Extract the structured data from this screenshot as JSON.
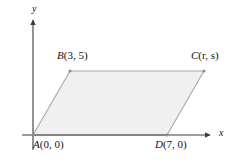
{
  "figure": {
    "type": "coordinate-geometry-diagram",
    "background_color": "#ffffff",
    "axes": {
      "x_axis_label": "x",
      "y_axis_label": "y",
      "axis_color": "#3a3a3a",
      "origin_px": {
        "x": 33,
        "y": 135
      },
      "x_axis_arrow_tip_px": {
        "x": 213,
        "y": 135
      },
      "y_axis_arrow_tip_px": {
        "x": 33,
        "y": 17
      }
    },
    "shape": {
      "name": "parallelogram",
      "fill_color": "#f0f0f0",
      "stroke_color": "#a8a8a8",
      "vertex_order": [
        "A",
        "B",
        "C",
        "D"
      ]
    },
    "points": [
      {
        "id": "A",
        "name": "A",
        "coords": "(0, 0)",
        "label": "A(0, 0)",
        "px": {
          "x": 33,
          "y": 135
        }
      },
      {
        "id": "B",
        "name": "B",
        "coords": "(3, 5)",
        "label": "B(3, 5)",
        "px": {
          "x": 70,
          "y": 71
        }
      },
      {
        "id": "C",
        "name": "C",
        "coords": "(r, s)",
        "label": "C(r, s)",
        "px": {
          "x": 204,
          "y": 71
        }
      },
      {
        "id": "D",
        "name": "D",
        "coords": "(7, 0)",
        "label": "D(7, 0)",
        "px": {
          "x": 167,
          "y": 135
        }
      }
    ]
  }
}
